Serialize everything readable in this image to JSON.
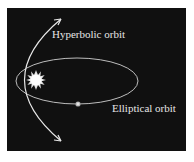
{
  "diagram": {
    "background_color": "#101010",
    "labels": {
      "hyperbolic": "Hyperbolic orbit",
      "elliptical": "Elliptical orbit"
    },
    "elements": {
      "sun": "sun-icon",
      "planet": "planet-dot",
      "ellipse": "elliptical-orbit-path",
      "hyperbola": "hyperbolic-orbit-path"
    }
  }
}
